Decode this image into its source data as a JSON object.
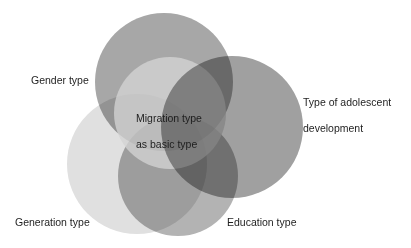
{
  "diagram": {
    "type": "venn",
    "center": {
      "label_line1": "Migration type",
      "label_line2": "as basic type",
      "cx": 170,
      "cy": 113,
      "r": 56,
      "color": "#d4d4d4"
    },
    "sets": [
      {
        "id": "gender",
        "label": "Gender type",
        "cx": 164,
        "cy": 82,
        "r": 69,
        "color": "#a7a7a7"
      },
      {
        "id": "adolescent",
        "label_line1": "Type of adolescent",
        "label_line2": "development",
        "cx": 232,
        "cy": 127,
        "r": 71,
        "color": "#a0a0a0"
      },
      {
        "id": "generation",
        "label": "Generation type",
        "cx": 137,
        "cy": 164,
        "r": 70,
        "color": "#e0e0e0"
      },
      {
        "id": "education",
        "label": "Education type",
        "cx": 178,
        "cy": 176,
        "r": 60,
        "color": "#b3b3b3"
      }
    ]
  }
}
